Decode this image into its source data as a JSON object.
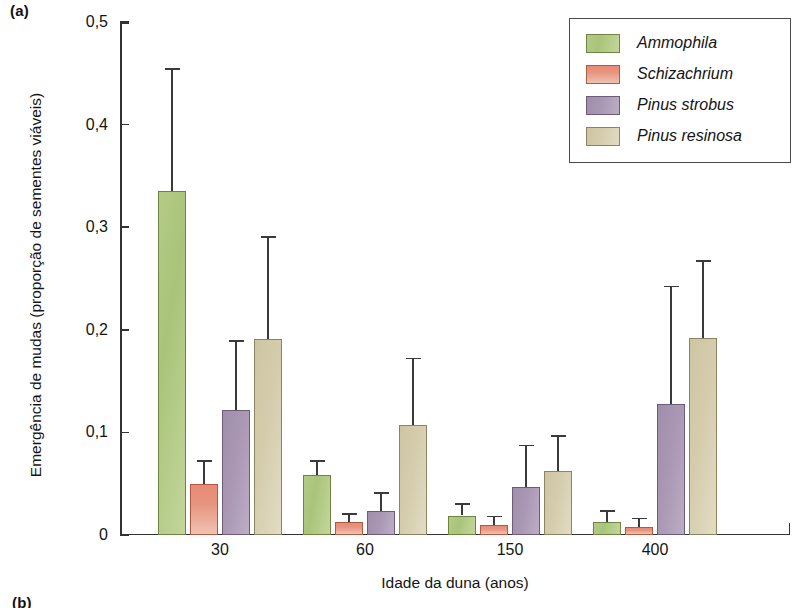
{
  "figure": {
    "panel_a_label": "(a)",
    "panel_b_label": "(b)"
  },
  "chart_data": {
    "type": "bar",
    "title": "",
    "subtitle": "",
    "xlabel": "Idade da duna (anos)",
    "ylabel": "Emergência de mudas (proporção de sementes viáveis)",
    "categories": [
      "30",
      "60",
      "150",
      "400"
    ],
    "ylim": [
      0,
      0.5
    ],
    "yticks": [
      0,
      0.1,
      0.2,
      0.3,
      0.4,
      0.5
    ],
    "ytick_labels": [
      "0",
      "0,1",
      "0,2",
      "0,3",
      "0,4",
      "0,5"
    ],
    "grid": false,
    "legend_position": "top-right",
    "error_bars": "upper-only",
    "series": [
      {
        "name": "Ammophila",
        "color": "#a9c47a",
        "values": [
          0.335,
          0.058,
          0.019,
          0.013
        ],
        "error_upper": [
          0.455,
          0.073,
          0.031,
          0.024
        ]
      },
      {
        "name": "Schizachrium",
        "color": "#e79581",
        "values": [
          0.05,
          0.013,
          0.01,
          0.008
        ],
        "error_upper": [
          0.073,
          0.021,
          0.019,
          0.017
        ]
      },
      {
        "name": "Pinus strobus",
        "color": "#a997b4",
        "values": [
          0.122,
          0.023,
          0.047,
          0.128
        ],
        "error_upper": [
          0.19,
          0.042,
          0.088,
          0.243
        ]
      },
      {
        "name": "Pinus resinosa",
        "color": "#d4ccac",
        "values": [
          0.191,
          0.107,
          0.062,
          0.192
        ],
        "error_upper": [
          0.291,
          0.173,
          0.097,
          0.268
        ]
      }
    ]
  }
}
